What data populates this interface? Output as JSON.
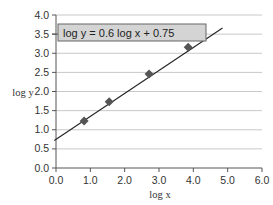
{
  "chart_data": {
    "type": "scatter",
    "title": "",
    "xlabel": "log x",
    "ylabel": "log y",
    "xlim": [
      0.0,
      6.0
    ],
    "ylim": [
      0.0,
      4.0
    ],
    "x_ticks": [
      "0.0",
      "1.0",
      "2.0",
      "3.0",
      "4.0",
      "5.0",
      "6.0"
    ],
    "y_ticks": [
      "0.0",
      "0.5",
      "1.0",
      "1.5",
      "2.0",
      "2.5",
      "3.0",
      "3.5",
      "4.0"
    ],
    "grid": {
      "horizontal": true,
      "vertical": false
    },
    "legend": null,
    "series": [
      {
        "name": "data",
        "marker": "diamond",
        "x": [
          0.82,
          1.55,
          2.71,
          3.85
        ],
        "y": [
          1.23,
          1.73,
          2.46,
          3.16
        ]
      }
    ],
    "trendline": {
      "equation": "log y = 0.6 log x + 0.75",
      "slope": 0.6,
      "intercept": 0.75,
      "x_range": [
        -0.05,
        4.85
      ]
    },
    "annotations": [
      {
        "text": "log y = 0.6 log x + 0.75",
        "position": "top-left inside plot"
      }
    ]
  },
  "colors": {
    "gridline": "#c8c8c8",
    "axis": "#555555",
    "marker": "#555555",
    "line": "#222222",
    "equation_box_fill": "#d4d4d4",
    "equation_box_border": "#666666"
  }
}
